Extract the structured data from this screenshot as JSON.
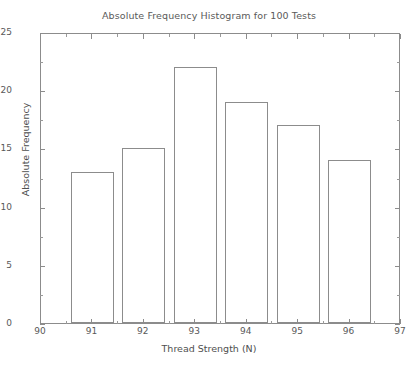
{
  "chart_data": {
    "type": "bar",
    "title": "Absolute Frequency Histogram for 100 Tests",
    "xlabel": "Thread Strength (N)",
    "ylabel": "Absolute Frequency",
    "categories": [
      91,
      92,
      93,
      94,
      95,
      96
    ],
    "values": [
      13,
      15,
      22,
      19,
      17,
      14
    ],
    "bar_width": 0.84,
    "xlim": [
      90,
      97
    ],
    "ylim": [
      0,
      25
    ],
    "xticks": [
      90,
      91,
      92,
      93,
      94,
      95,
      96,
      97
    ],
    "xtick_labels": [
      "90",
      "91",
      "92",
      "93",
      "94",
      "95",
      "96",
      "97"
    ],
    "yticks": [
      0,
      5,
      10,
      15,
      20,
      25
    ],
    "ytick_labels": [
      "0",
      "5",
      "10",
      "15",
      "20",
      "25"
    ],
    "grid": false,
    "legend": null,
    "bar_fill": "#ffffff",
    "bar_edge": "#8c8c8c",
    "axis_color": "#8c8c8c",
    "background": "#ffffff"
  }
}
